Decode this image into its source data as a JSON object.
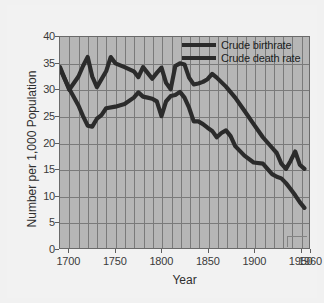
{
  "chart_data": {
    "type": "line",
    "title": "",
    "xlabel": "Year",
    "ylabel": "Number per 1,000 Population",
    "xlim": [
      1690,
      1960
    ],
    "ylim": [
      0,
      40
    ],
    "xticks": [
      1700,
      1750,
      1800,
      1850,
      1900,
      1950,
      1960
    ],
    "yticks": [
      0,
      5,
      10,
      15,
      20,
      25,
      30,
      35,
      40
    ],
    "grid": true,
    "grid_x_step": 10,
    "grid_y_step": 5,
    "legend_position": "top-right",
    "series": [
      {
        "name": "Crude birthrate",
        "color": "#2b2b2b",
        "x": [
          1690,
          1700,
          1710,
          1715,
          1720,
          1725,
          1730,
          1740,
          1745,
          1750,
          1760,
          1770,
          1775,
          1780,
          1785,
          1790,
          1795,
          1800,
          1805,
          1810,
          1815,
          1820,
          1825,
          1830,
          1835,
          1840,
          1845,
          1850,
          1855,
          1860,
          1870,
          1880,
          1890,
          1900,
          1910,
          1920,
          1925,
          1930,
          1935,
          1940,
          1945,
          1950,
          1955
        ],
        "y": [
          34.3,
          30.0,
          32.5,
          34.5,
          36.2,
          32.5,
          30.5,
          33.5,
          36.2,
          35.0,
          34.3,
          33.5,
          32.4,
          34.3,
          33.2,
          32.1,
          33.2,
          34.2,
          31.3,
          30.1,
          34.5,
          35.0,
          34.8,
          32.3,
          31.0,
          31.2,
          31.5,
          32.0,
          33.0,
          32.3,
          30.6,
          28.5,
          26.0,
          23.5,
          21.0,
          19.0,
          18.0,
          16.0,
          15.0,
          16.5,
          18.3,
          15.8,
          15.0
        ]
      },
      {
        "name": "Crude death rate",
        "color": "#2b2b2b",
        "x": [
          1690,
          1700,
          1710,
          1715,
          1720,
          1725,
          1730,
          1735,
          1740,
          1750,
          1760,
          1770,
          1775,
          1780,
          1785,
          1790,
          1795,
          1800,
          1805,
          1810,
          1815,
          1820,
          1825,
          1830,
          1835,
          1840,
          1845,
          1850,
          1855,
          1860,
          1865,
          1870,
          1875,
          1880,
          1890,
          1900,
          1910,
          1920,
          1925,
          1930,
          1935,
          1940,
          1945,
          1950,
          1955
        ],
        "y": [
          34.0,
          30.2,
          27.0,
          25.0,
          23.2,
          23.0,
          24.5,
          25.2,
          26.5,
          26.8,
          27.3,
          28.5,
          29.5,
          28.7,
          28.5,
          28.3,
          27.8,
          25.0,
          27.8,
          28.8,
          29.0,
          29.6,
          28.5,
          26.6,
          24.0,
          24.0,
          23.5,
          22.8,
          22.2,
          21.0,
          21.8,
          22.3,
          21.2,
          19.3,
          17.5,
          16.2,
          16.0,
          14.0,
          13.5,
          13.2,
          12.3,
          11.2,
          10.0,
          8.7,
          7.6
        ]
      }
    ]
  },
  "axes": {
    "y_label": "Number per 1,000 Population",
    "x_label": "Year",
    "y_tick_labels": [
      "40",
      "35",
      "30",
      "25",
      "20",
      "15",
      "10",
      "5",
      "0"
    ],
    "x_tick_labels": [
      "1700",
      "1750",
      "1800",
      "1850",
      "1900",
      "1950",
      "1960"
    ]
  },
  "legend": {
    "items": [
      {
        "label": "Crude birthrate"
      },
      {
        "label": "Crude death rate"
      }
    ]
  }
}
